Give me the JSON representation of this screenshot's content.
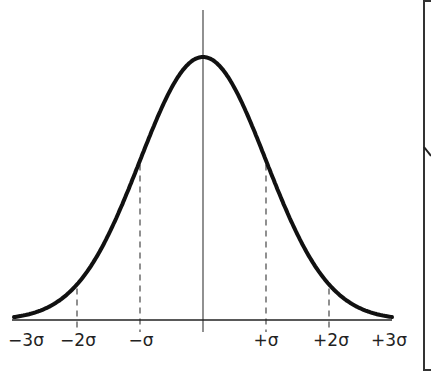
{
  "chart_data": {
    "type": "line",
    "title": "",
    "xlabel": "",
    "ylabel": "",
    "x_ticks": [
      "−3σ",
      "−2σ",
      "−σ",
      "",
      "+σ",
      "+2σ",
      "+3σ"
    ],
    "x_values": [
      -3,
      -2,
      -1,
      0,
      1,
      2,
      3
    ],
    "dashed_markers": [
      -2,
      -1,
      1,
      2
    ],
    "center_line": 0,
    "grid": false
  },
  "labels": {
    "minus3": "−3σ",
    "minus2": "−2σ",
    "minus1": "−σ",
    "plus1": "+σ",
    "plus2": "+2σ",
    "plus3": "+3σ"
  },
  "colors": {
    "curve": "#111111",
    "axis": "#222222",
    "dashed": "#555555",
    "background": "#ffffff"
  }
}
